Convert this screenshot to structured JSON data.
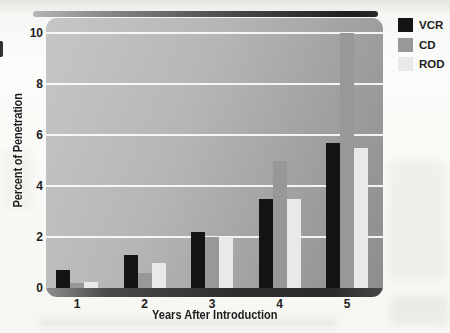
{
  "figure": {
    "kind": "scanned-textbook-bar-chart"
  },
  "axes": {
    "x_title": "Years After Introduction",
    "y_title": "Percent of Penetration",
    "x_ticks": [
      "1",
      "2",
      "3",
      "4",
      "5"
    ],
    "y_ticks": [
      "0",
      "2",
      "4",
      "6",
      "8",
      "10"
    ]
  },
  "legend": {
    "items": [
      {
        "label": "VCR",
        "color": "#141414"
      },
      {
        "label": "CD",
        "color": "#989898"
      },
      {
        "label": "ROD",
        "color": "#e9e9e7"
      }
    ]
  },
  "chart_data": {
    "type": "bar",
    "title": "",
    "xlabel": "Years After Introduction",
    "ylabel": "Percent of Penetration",
    "categories": [
      "1",
      "2",
      "3",
      "4",
      "5"
    ],
    "series": [
      {
        "name": "VCR",
        "color": "#141414",
        "values": [
          0.7,
          1.3,
          2.2,
          3.5,
          5.7
        ]
      },
      {
        "name": "CD",
        "color": "#989898",
        "values": [
          0.2,
          0.6,
          2.0,
          5.0,
          10.0
        ]
      },
      {
        "name": "ROD",
        "color": "#e9e9e7",
        "values": [
          0.25,
          1.0,
          2.0,
          3.5,
          5.5
        ]
      }
    ],
    "ylim": [
      0,
      10
    ],
    "yticks": [
      0,
      2,
      4,
      6,
      8,
      10
    ],
    "grid": "horizontal-white-every-2",
    "legend_position": "top-right"
  },
  "colors": {
    "plot_bg_light": "#c6c6c6",
    "plot_bg_dark": "#8d8d8d",
    "gridline": "#ffffff",
    "baseline_shadow": "#2e2e2e",
    "page_bg": "#f8f8f6"
  }
}
